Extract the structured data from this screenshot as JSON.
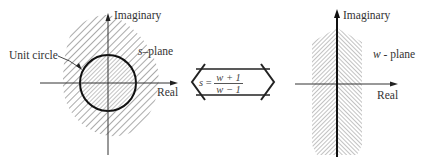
{
  "left_diagram": {
    "name": "s-plane",
    "axis_vertical_label": "Imaginary",
    "axis_horizontal_label": "Real",
    "plane_label_var": "s",
    "plane_label_text": "–plane",
    "circle_label": "Unit circle"
  },
  "mapping": {
    "lhs": "s",
    "equals": "=",
    "numerator": "w + 1",
    "denominator": "w − 1"
  },
  "right_diagram": {
    "name": "w-plane",
    "axis_vertical_label": "Imaginary",
    "axis_horizontal_label": "Real",
    "plane_label_var": "w",
    "plane_label_text": " - plane"
  },
  "colors": {
    "line": "#222222",
    "hatch": "#555555",
    "background": "#ffffff"
  }
}
